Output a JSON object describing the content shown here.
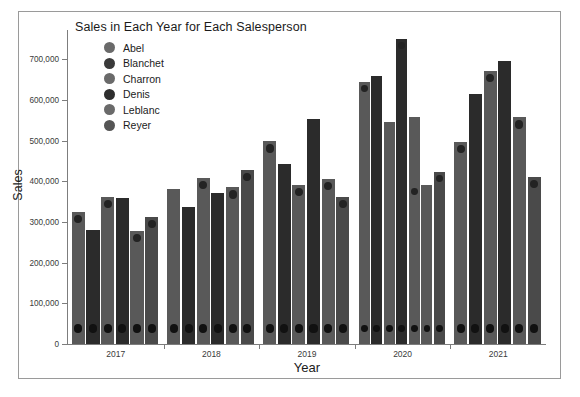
{
  "chart_data": {
    "type": "bar",
    "title": "Sales in Each Year for Each Salesperson",
    "xlabel": "Year",
    "ylabel": "Sales",
    "categories": [
      "2017",
      "2018",
      "2019",
      "2020",
      "2021"
    ],
    "ylim": [
      0,
      750000
    ],
    "yticks": [
      0,
      100000,
      200000,
      300000,
      400000,
      500000,
      600000,
      700000
    ],
    "ytick_labels": [
      "0",
      "100,000",
      "200,000",
      "300,000",
      "400,000",
      "500,000",
      "600,000",
      "700,000"
    ],
    "grid": false,
    "legend_position": "upper-left-inside",
    "series": [
      {
        "name": "Abel",
        "color": "#595959",
        "values": [
          325000,
          382000,
          498000,
          643000,
          497000
        ]
      },
      {
        "name": "Blanchet",
        "color": "#2b2b2b",
        "values": [
          280000,
          337000,
          443000,
          660000,
          615000
        ]
      },
      {
        "name": "Charron",
        "color": "#595959",
        "values": [
          362000,
          408000,
          390000,
          546000,
          672000
        ]
      },
      {
        "name": "Denis",
        "color": "#2b2b2b",
        "values": [
          358000,
          372000,
          553000,
          750000,
          695000
        ]
      },
      {
        "name": "Leblanc",
        "color": "#595959",
        "values": [
          278000,
          385000,
          405000,
          558000,
          557000
        ]
      },
      {
        "name": "Reyer",
        "color": "#4a4a4a",
        "values": [
          312000,
          428000,
          362000,
          423000,
          410000
        ]
      }
    ],
    "extra_bar_2020": {
      "name": "Leblanc-second",
      "color": "#595959",
      "value": 390000
    },
    "marker_dots": {
      "low_row_value": 38000,
      "top_markers": {
        "2017": {
          "Abel": 325000,
          "Charron": 362000,
          "Leblanc": 278000,
          "Reyer": 312000
        },
        "2018": {
          "Charron": 408000,
          "Leblanc": 385000,
          "Reyer": 428000
        },
        "2019": {
          "Abel": 498000,
          "Charron": 390000,
          "Leblanc": 405000,
          "Reyer": 362000
        },
        "2020": {
          "Abel": 643000,
          "Denis": 750000,
          "Leblanc": 390000,
          "Reyer": 423000
        },
        "2021": {
          "Abel": 497000,
          "Charron": 672000,
          "Leblanc": 557000,
          "Reyer": 410000
        }
      }
    }
  },
  "legend": {
    "items": [
      {
        "label": "Abel",
        "color": "#6a6a6a"
      },
      {
        "label": "Blanchet",
        "color": "#3a3a3a"
      },
      {
        "label": "Charron",
        "color": "#6a6a6a"
      },
      {
        "label": "Denis",
        "color": "#2e2e2e"
      },
      {
        "label": "Leblanc",
        "color": "#6a6a6a"
      },
      {
        "label": "Reyer",
        "color": "#555555"
      }
    ]
  },
  "style": {
    "background": "#ffffff",
    "border_color": "#9a9a9a",
    "axis_color": "#7d7d7d",
    "text_color": "#1b1b1b"
  }
}
